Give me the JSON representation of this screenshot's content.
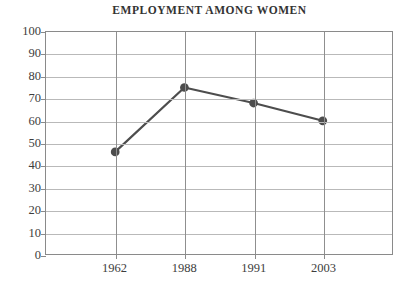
{
  "chart_data": {
    "type": "line",
    "title": "EMPLOYMENT AMONG WOMEN",
    "subtitle": "",
    "xlabel": "",
    "ylabel": "",
    "categories": [
      "1962",
      "1988",
      "1991",
      "2003"
    ],
    "values": [
      46,
      75,
      68,
      60
    ],
    "series": [
      {
        "name": "Employment among women",
        "values": [
          46,
          75,
          68,
          60
        ]
      }
    ],
    "ylim": [
      0,
      100
    ],
    "ytick_step": 10,
    "yticks": [
      "100",
      "90",
      "80",
      "70",
      "60",
      "50",
      "40",
      "30",
      "20",
      "10",
      "0"
    ],
    "grid": {
      "horizontal": true,
      "vertical": true
    },
    "legend": {
      "visible": false,
      "position": "none"
    },
    "markers": {
      "shape": "circle",
      "visible": true
    },
    "colors": {
      "line": "#4d4d4d",
      "marker": "#4d4d4d",
      "frame": "#8a8a8a",
      "hgrid": "#b9b9b9",
      "vgrid": "#8f8f8f",
      "background": "#ffffff",
      "text": "#3d3d3d",
      "title": "#333333"
    }
  }
}
